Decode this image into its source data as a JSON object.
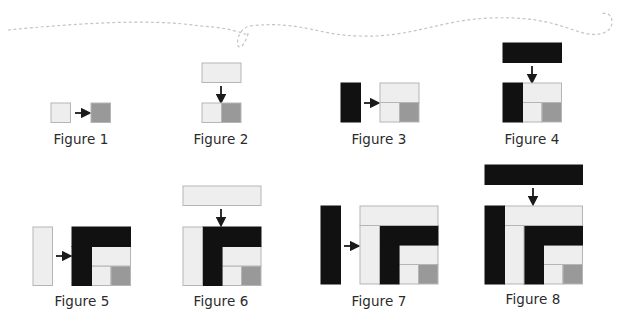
{
  "colors": {
    "light": "#eeeeee",
    "medium": "#999999",
    "dark": "#111111",
    "outline": "#b5b5b5",
    "arrow": "#1a1a1a",
    "thread": "#c4c4c4"
  },
  "figures": [
    {
      "label": "Figure 1"
    },
    {
      "label": "Figure 2"
    },
    {
      "label": "Figure 3"
    },
    {
      "label": "Figure 4"
    },
    {
      "label": "Figure 5"
    },
    {
      "label": "Figure 6"
    },
    {
      "label": "Figure 7"
    },
    {
      "label": "Figure 8"
    }
  ],
  "decoration": {
    "thread": "dashed-thread-line"
  }
}
